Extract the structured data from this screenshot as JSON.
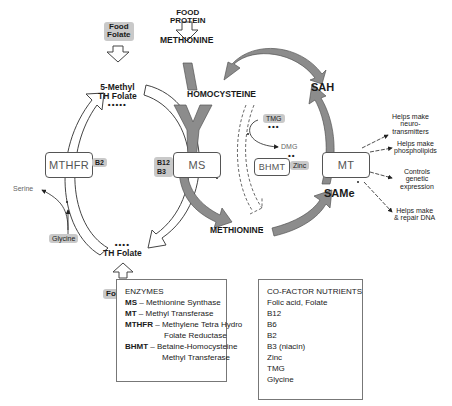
{
  "inputs": {
    "food_protein": "FOOD\nPROTEIN",
    "food_folate": "Food\nFolate",
    "folic_acid": "Folic acid"
  },
  "metabolites": {
    "methionine_top": "METHIONINE",
    "homocysteine": "HOMOCYSTEINE",
    "sah": "SAH",
    "same": "SAMe",
    "methionine_bottom": "METHIONINE",
    "methyl_th_folate_line1": "5-Methyl",
    "methyl_th_folate_line2": "TH Folate",
    "methyl_th_folate_dots": "•••••",
    "th_folate": "TH Folate",
    "th_folate_dots": "••••",
    "serine": "Serine",
    "glycine": "Glycine",
    "tmg": "TMG",
    "tmg_dots": "•••",
    "dmg": "DMG",
    "dmg_dots": "••"
  },
  "enzymes": {
    "mthfr": "MTHFR",
    "ms": "MS",
    "bhmt": "BHMT",
    "mt": "MT"
  },
  "cofactor_chips": {
    "mthfr": "B2",
    "ms_line1": "B12",
    "ms_line2": "B3",
    "bhmt": "Zinc"
  },
  "outputs": [
    {
      "line1": "Helps make",
      "line2": "neuro-",
      "line3": "transmitters"
    },
    {
      "line1": "Helps make",
      "line2": "phospholipids",
      "line3": ""
    },
    {
      "line1": "Controls",
      "line2": "genetic",
      "line3": "expression"
    },
    {
      "line1": "Helps make",
      "line2": "& repair DNA",
      "line3": ""
    }
  ],
  "legend_enzymes": {
    "title": "ENZYMES",
    "items": [
      {
        "abbr": "MS",
        "name": "– Methionine Synthase",
        "cont": ""
      },
      {
        "abbr": "MT",
        "name": "– Methyl Transferase",
        "cont": ""
      },
      {
        "abbr": "MTHFR",
        "name": "– Methylene Tetra Hydro",
        "cont": "Folate Reductase"
      },
      {
        "abbr": "BHMT",
        "name": "– Betaine-Homocysteine",
        "cont": "Methyl Transferase"
      }
    ]
  },
  "legend_cofactors": {
    "title": "CO-FACTOR NUTRIENTS",
    "items": [
      "Folic acid, Folate",
      "B12",
      "B6",
      "B2",
      "B3 (niacin)",
      "Zinc",
      "TMG",
      "Glycine"
    ]
  },
  "colors": {
    "gray_arrow": "#8c8c8c",
    "chip": "#c9c9c9",
    "outline": "#444444"
  }
}
